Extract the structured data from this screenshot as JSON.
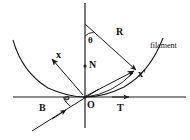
{
  "figure": {
    "kind": "geometry-scattering-diagram",
    "background_color": "#ffffff",
    "stroke_color": "#1a1a1a",
    "text_color": "#111111",
    "width": 190,
    "height": 140
  },
  "labels": {
    "theta": "θ",
    "phi": "φ",
    "normal": "N",
    "radius": "R",
    "incident": "x",
    "scattered": "x'",
    "tangent": "T",
    "binormal": "B",
    "origin": "O",
    "filament": "filament"
  },
  "geometry": {
    "origin": {
      "x": 85,
      "y": 97
    },
    "vertical_axis": {
      "x1": 85,
      "y1": 3,
      "x2": 85,
      "y2": 128
    },
    "horizontal_axis": {
      "x1": 13,
      "y1": 97,
      "x2": 186,
      "y2": 97
    },
    "theta_vertex": {
      "x": 85,
      "y": 24
    },
    "ray_R_end": {
      "x": 136,
      "y": 70
    },
    "x_arrow_tip": {
      "x": 52,
      "y": 59
    },
    "b_line_start": {
      "x": 32,
      "y": 131
    },
    "t_arrow_tip": {
      "x": 128,
      "y": 97
    },
    "curve_left_end": {
      "x": 13,
      "y": 40
    },
    "curve_right_end": {
      "x": 163,
      "y": 38
    }
  },
  "markers": {
    "normal_dot": {
      "x": 85,
      "y": 66
    },
    "origin_dot": {
      "x": 85,
      "y": 97
    }
  }
}
